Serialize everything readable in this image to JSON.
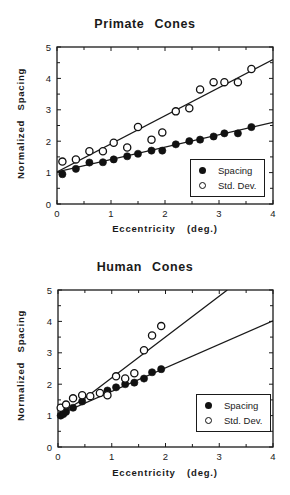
{
  "chart_data": [
    {
      "type": "scatter",
      "title": "Primate Cones",
      "xlabel": "Eccentricity (deg.)",
      "ylabel": "Normalized Spacing",
      "xlim": [
        0,
        4
      ],
      "ylim": [
        0,
        5
      ],
      "xticks": [
        0,
        1,
        2,
        3,
        4
      ],
      "yticks": [
        0,
        1,
        2,
        3,
        4,
        5
      ],
      "grid": false,
      "legend_position": "lower right",
      "series": [
        {
          "name": "Spacing",
          "marker": "filled-circle",
          "x": [
            0.1,
            0.35,
            0.6,
            0.85,
            1.05,
            1.3,
            1.5,
            1.75,
            1.95,
            2.2,
            2.45,
            2.65,
            2.9,
            3.1,
            3.35,
            3.6
          ],
          "y": [
            0.95,
            1.12,
            1.32,
            1.33,
            1.42,
            1.52,
            1.6,
            1.7,
            1.7,
            1.9,
            2.0,
            2.05,
            2.15,
            2.25,
            2.25,
            2.45
          ],
          "fit_line": [
            [
              0,
              1.02
            ],
            [
              4,
              2.6
            ]
          ]
        },
        {
          "name": "Std. Dev.",
          "marker": "open-circle",
          "x": [
            0.1,
            0.35,
            0.6,
            0.85,
            1.05,
            1.3,
            1.5,
            1.75,
            1.95,
            2.2,
            2.45,
            2.65,
            2.9,
            3.1,
            3.35,
            3.6
          ],
          "y": [
            1.35,
            1.42,
            1.68,
            1.68,
            1.95,
            1.8,
            2.45,
            2.05,
            2.28,
            2.95,
            3.05,
            3.65,
            3.88,
            3.88,
            3.88,
            4.3
          ],
          "fit_line": [
            [
              0,
              1.02
            ],
            [
              4,
              4.6
            ]
          ]
        }
      ]
    },
    {
      "type": "scatter",
      "title": "Human Cones",
      "xlabel": "Eccentricity (deg.)",
      "ylabel": "Normalized Spacing",
      "xlim": [
        0,
        4
      ],
      "ylim": [
        0,
        5
      ],
      "xticks": [
        0,
        1,
        2,
        3,
        4
      ],
      "yticks": [
        0,
        1,
        2,
        3,
        4,
        5
      ],
      "grid": false,
      "legend_position": "lower right",
      "series": [
        {
          "name": "Spacing",
          "marker": "filled-circle",
          "x": [
            0.05,
            0.1,
            0.15,
            0.28,
            0.45,
            0.92,
            1.08,
            1.25,
            1.42,
            1.6,
            1.75,
            1.92
          ],
          "y": [
            1.0,
            1.05,
            1.12,
            1.25,
            1.45,
            1.8,
            1.9,
            2.0,
            2.05,
            2.18,
            2.38,
            2.48
          ],
          "fit_line": [
            [
              0,
              1.02
            ],
            [
              4,
              4.02
            ]
          ]
        },
        {
          "name": "Std. Dev.",
          "marker": "open-circle",
          "x": [
            0.05,
            0.15,
            0.28,
            0.45,
            0.6,
            0.78,
            0.92,
            1.08,
            1.25,
            1.42,
            1.6,
            1.75,
            1.92
          ],
          "y": [
            1.25,
            1.35,
            1.55,
            1.65,
            1.62,
            1.72,
            1.65,
            2.25,
            2.18,
            2.35,
            3.08,
            3.55,
            3.85
          ],
          "fit_line": [
            [
              0,
              1.02
            ],
            [
              0.5,
              1.55
            ],
            [
              3.15,
              5.0
            ]
          ]
        }
      ]
    }
  ],
  "charts": {
    "top": {
      "title": "Primate Cones",
      "ylabel": "Normalized Spacing",
      "xlabel": "Eccentricity (deg.)",
      "legend": {
        "spacing": "Spacing",
        "stddev": "Std. Dev."
      }
    },
    "bottom": {
      "title": "Human Cones",
      "ylabel": "Normalized Spacing",
      "xlabel": "Eccentricity (deg.)",
      "legend": {
        "spacing": "Spacing",
        "stddev": "Std. Dev."
      }
    }
  },
  "colors": {
    "ink": "#1a1a1a",
    "background": "#ffffff"
  }
}
